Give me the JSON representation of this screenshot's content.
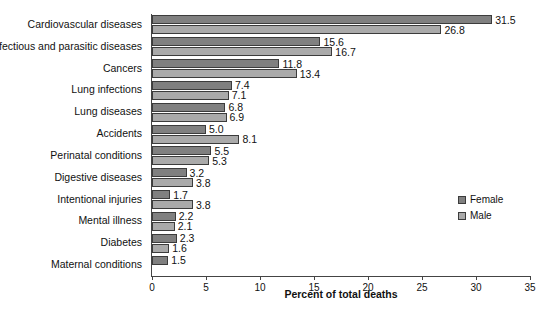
{
  "chart_data": {
    "type": "bar",
    "orientation": "horizontal",
    "title": "",
    "xlabel": "Percent of total deaths",
    "ylabel": "",
    "xlim": [
      0,
      35
    ],
    "xticks": [
      "0",
      "5",
      "10",
      "15",
      "20",
      "25",
      "30",
      "35"
    ],
    "grid": false,
    "legend_position": "right-middle",
    "categories": [
      "Cardiovascular diseases",
      "Infectious and parasitic diseases",
      "Cancers",
      "Lung infections",
      "Lung diseases",
      "Accidents",
      "Perinatal conditions",
      "Digestive diseases",
      "Intentional injuries",
      "Mental illness",
      "Diabetes",
      "Maternal conditions"
    ],
    "series": [
      {
        "name": "Female",
        "color": "#808080",
        "values": [
          31.5,
          15.6,
          11.8,
          7.4,
          6.8,
          5.0,
          5.5,
          3.2,
          1.7,
          2.2,
          2.3,
          1.5
        ],
        "labels": [
          "31.5",
          "15.6",
          "11.8",
          "7.4",
          "6.8",
          "5.0",
          "5.5",
          "3.2",
          "1.7",
          "2.2",
          "2.3",
          "1.5"
        ]
      },
      {
        "name": "Male",
        "color": "#aaaaaa",
        "values": [
          26.8,
          16.7,
          13.4,
          7.1,
          6.9,
          8.1,
          5.3,
          3.8,
          3.8,
          2.1,
          1.6,
          null
        ],
        "labels": [
          "26.8",
          "16.7",
          "13.4",
          "7.1",
          "6.9",
          "8.1",
          "5.3",
          "3.8",
          "3.8",
          "2.1",
          "1.6",
          ""
        ]
      }
    ]
  },
  "axis": {
    "x_title": "Percent of total deaths",
    "ticks": [
      "0",
      "5",
      "10",
      "15",
      "20",
      "25",
      "30",
      "35"
    ]
  },
  "legend": {
    "items": [
      {
        "label": "Female"
      },
      {
        "label": "Male"
      }
    ]
  }
}
